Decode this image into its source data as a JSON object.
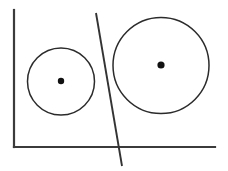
{
  "figure": {
    "width": 228,
    "height": 171,
    "background_color": "#ffffff",
    "stroke_color": "#2b2b2b",
    "axis_color": "#3b3b3b",
    "divider_color": "#333333",
    "dot_color": "#111111"
  },
  "axes": {
    "name": "l-shaped-axis-frame",
    "vertical": {
      "label": "vertical-axis",
      "x1": 14,
      "y1": 10,
      "x2": 14,
      "y2": 147,
      "stroke_width": 2.2
    },
    "horizontal": {
      "label": "horizontal-axis",
      "x1": 14,
      "y1": 147,
      "x2": 215,
      "y2": 147,
      "stroke_width": 2.2
    }
  },
  "divider": {
    "label": "separating-line",
    "x1": 96,
    "y1": 13,
    "x2": 122,
    "y2": 166,
    "stroke_width": 1.9
  },
  "shapes": [
    {
      "id": "small-circle",
      "label": "small-circle",
      "cx": 61,
      "cy": 81.5,
      "r": 33.5,
      "diameter": 67,
      "stroke_width": 1.5,
      "fill": "none",
      "center_dot": {
        "cx": 61,
        "cy": 81,
        "r": 3.2
      }
    },
    {
      "id": "large-circle",
      "label": "large-circle",
      "cx": 161,
      "cy": 65.5,
      "r": 48,
      "diameter": 96,
      "stroke_width": 1.5,
      "fill": "none",
      "center_dot": {
        "cx": 161,
        "cy": 65,
        "r": 3.6
      }
    }
  ]
}
